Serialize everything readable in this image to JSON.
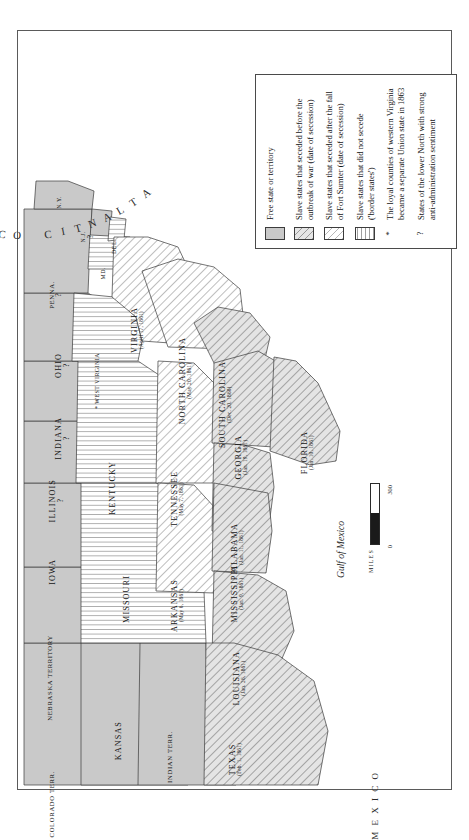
{
  "map": {
    "title": "Secession of the Southern States, 1860-1861",
    "ocean_label": "ATLANTIC OCEAN",
    "gulf_label": "Gulf of Mexico",
    "mexico_label": "M E X I C O"
  },
  "legend": {
    "items": [
      {
        "swatch": "solid-gray",
        "text": "Free state or territory"
      },
      {
        "swatch": "gray-diagonal-hatch",
        "text": "Slave states that seceded before the outbreak of war (date of secession)"
      },
      {
        "swatch": "white-diagonal-hatch",
        "text": "Slave states that seceded after the fall of Fort Sumter (date of secession)"
      },
      {
        "swatch": "horizontal-lines",
        "text": "Slave states that did not secede ('border states')"
      }
    ],
    "notes": [
      {
        "marker": "*",
        "text": "The loyal counties of western Virginia became a separate Union state in 1863"
      },
      {
        "marker": "?",
        "text": "States of the lower North with strong anti-administration sentiment"
      }
    ]
  },
  "scale": {
    "zero": "0",
    "max": "300",
    "units": "MILES"
  },
  "states": [
    {
      "id": "new-york",
      "name": "N.Y.",
      "date": "",
      "marker": "",
      "fill": "free"
    },
    {
      "id": "new-jersey",
      "name": "N.J.",
      "date": "",
      "marker": "?",
      "fill": "free"
    },
    {
      "id": "pennsylvania",
      "name": "PENNA.",
      "date": "",
      "marker": "?",
      "fill": "free"
    },
    {
      "id": "delaware",
      "name": "DEL.",
      "date": "",
      "marker": "",
      "fill": "border"
    },
    {
      "id": "maryland",
      "name": "MD.",
      "date": "",
      "marker": "",
      "fill": "border"
    },
    {
      "id": "ohio",
      "name": "OHIO",
      "date": "",
      "marker": "?",
      "fill": "free"
    },
    {
      "id": "indiana",
      "name": "INDIANA",
      "date": "",
      "marker": "?",
      "fill": "free"
    },
    {
      "id": "illinois",
      "name": "ILLINOIS",
      "date": "",
      "marker": "?",
      "fill": "free"
    },
    {
      "id": "iowa",
      "name": "IOWA",
      "date": "",
      "marker": "",
      "fill": "free"
    },
    {
      "id": "nebraska-territory",
      "name": "NEBRASKA TERRITORY",
      "date": "",
      "marker": "",
      "fill": "free"
    },
    {
      "id": "kansas",
      "name": "KANSAS",
      "date": "",
      "marker": "",
      "fill": "free"
    },
    {
      "id": "colorado-territory",
      "name": "COLORADO TERR.",
      "date": "",
      "marker": "",
      "fill": "free"
    },
    {
      "id": "indian-territory",
      "name": "INDIAN TERR.",
      "date": "",
      "marker": "",
      "fill": "free"
    },
    {
      "id": "missouri",
      "name": "MISSOURI",
      "date": "",
      "marker": "",
      "fill": "border"
    },
    {
      "id": "kentucky",
      "name": "KENTUCKY",
      "date": "",
      "marker": "",
      "fill": "border"
    },
    {
      "id": "west-virginia",
      "name": "WEST VIRGINIA",
      "date": "",
      "marker": "*",
      "fill": "border"
    },
    {
      "id": "virginia",
      "name": "VIRGINIA",
      "date": "(April 17, 1861)",
      "marker": "",
      "fill": "late"
    },
    {
      "id": "north-carolina",
      "name": "NORTH CAROLINA",
      "date": "(May 20, 1861)",
      "marker": "",
      "fill": "late"
    },
    {
      "id": "tennessee",
      "name": "TENNESSEE",
      "date": "(May 7, 1861)",
      "marker": "",
      "fill": "late"
    },
    {
      "id": "arkansas",
      "name": "ARKANSAS",
      "date": "(May 6, 1861)",
      "marker": "",
      "fill": "late"
    },
    {
      "id": "south-carolina",
      "name": "SOUTH CAROLINA",
      "date": "(Dec. 20, 1860)",
      "marker": "",
      "fill": "early"
    },
    {
      "id": "georgia",
      "name": "GEORGIA",
      "date": "(Jan. 19, 1861)",
      "marker": "",
      "fill": "early"
    },
    {
      "id": "florida",
      "name": "FLORIDA",
      "date": "(Jan. 10, 1861)",
      "marker": "",
      "fill": "early"
    },
    {
      "id": "alabama",
      "name": "ALABAMA",
      "date": "(Jan. 11, 1861)",
      "marker": "",
      "fill": "early"
    },
    {
      "id": "mississippi",
      "name": "MISSISSIPPI",
      "date": "(Jan. 9, 1861)",
      "marker": "",
      "fill": "early"
    },
    {
      "id": "louisiana",
      "name": "LOUISIANA",
      "date": "(Jan. 26, 1861)",
      "marker": "",
      "fill": "early"
    },
    {
      "id": "texas",
      "name": "TEXAS",
      "date": "(Feb. 1, 1861)",
      "marker": "",
      "fill": "early"
    }
  ]
}
